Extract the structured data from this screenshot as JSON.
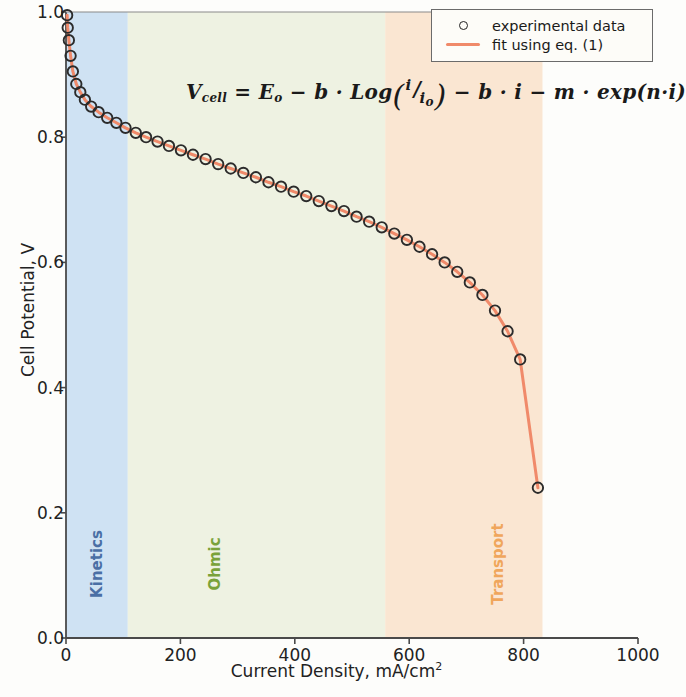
{
  "chart_data": {
    "type": "scatter",
    "title": "",
    "xlabel": "Current Density, mA/cm",
    "xlabel_sup": "2",
    "ylabel": "Cell Potential, V",
    "xlim": [
      0,
      1000
    ],
    "ylim": [
      0.0,
      1.0
    ],
    "xticks": [
      "0",
      "200",
      "400",
      "600",
      "800",
      "1000"
    ],
    "xtick_values": [
      0,
      200,
      400,
      600,
      800,
      1000
    ],
    "yticks": [
      "0.0",
      "0.2",
      "0.4",
      "0.6",
      "0.8",
      "1.0"
    ],
    "ytick_values": [
      0.0,
      0.2,
      0.4,
      0.6,
      0.8,
      1.0
    ],
    "grid": false,
    "legend_position": "top right",
    "series": [
      {
        "name": "experimental data",
        "marker": "open-circle",
        "marker_color": "#2b2b2b",
        "x": [
          2,
          3,
          5,
          8,
          12,
          18,
          25,
          33,
          44,
          57,
          72,
          88,
          104,
          122,
          140,
          160,
          180,
          201,
          222,
          244,
          266,
          288,
          310,
          332,
          354,
          376,
          398,
          420,
          442,
          464,
          486,
          508,
          530,
          552,
          574,
          596,
          618,
          640,
          662,
          684,
          706,
          728,
          750,
          772,
          794,
          825
        ],
        "y": [
          0.995,
          0.975,
          0.955,
          0.93,
          0.905,
          0.885,
          0.872,
          0.86,
          0.849,
          0.84,
          0.831,
          0.823,
          0.815,
          0.807,
          0.8,
          0.793,
          0.786,
          0.779,
          0.772,
          0.765,
          0.757,
          0.75,
          0.743,
          0.736,
          0.728,
          0.721,
          0.713,
          0.706,
          0.698,
          0.69,
          0.682,
          0.673,
          0.665,
          0.656,
          0.646,
          0.636,
          0.625,
          0.613,
          0.6,
          0.585,
          0.568,
          0.548,
          0.523,
          0.49,
          0.445,
          0.24
        ]
      },
      {
        "name": "fit using eq. (1)",
        "marker": "line",
        "line_color": "#f08a6a",
        "x": [
          0,
          1000
        ],
        "y": [
          1.0,
          0.0
        ]
      }
    ],
    "regions": [
      {
        "label": "Kinetics",
        "x_start": 0,
        "x_end": 108,
        "fill": "#cfe2f3",
        "text_color": "#4a6fa5"
      },
      {
        "label": "Ohmic",
        "x_start": 108,
        "x_end": 558,
        "fill": "#eef2e2",
        "text_color": "#7aa23a"
      },
      {
        "label": "Transport",
        "x_start": 558,
        "x_end": 833,
        "fill": "#fae6d2",
        "text_color": "#f0a65c"
      }
    ],
    "annotations": [
      {
        "name": "equation",
        "text": "V_cell = E_o - b . Log(i / i_o) - b . i - m . exp(n . i)"
      }
    ]
  },
  "legend": {
    "entries": [
      {
        "label": "experimental data",
        "key": "open-circle"
      },
      {
        "label": "fit using eq. (1)",
        "key": "line"
      }
    ]
  },
  "equation": {
    "lhs_var": "V",
    "lhs_sub": "cell",
    "eq": "=",
    "e_var": "E",
    "e_sub": "o",
    "minus1": "−",
    "b1": "b",
    "dot1": "·",
    "log": "Log",
    "num_i": "i",
    "slash": "/",
    "den_i": "i",
    "den_sub": "o",
    "minus2": "−",
    "b2": "b",
    "dot2": "·",
    "i2": "i",
    "minus3": "−",
    "m": "m",
    "dot3": "·",
    "exp": "exp",
    "n": "n",
    "dot4": "·",
    "i3": "i"
  }
}
